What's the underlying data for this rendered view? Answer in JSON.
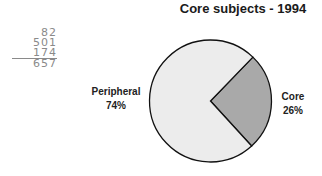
{
  "chart_data": {
    "type": "pie",
    "title": "Core subjects - 1994",
    "categories": [
      "Core",
      "Peripheral"
    ],
    "values": [
      26,
      74
    ],
    "labels": [
      {
        "name": "Core",
        "value": "26%"
      },
      {
        "name": "Peripheral",
        "value": "74%"
      }
    ],
    "colors": {
      "Core": "#a9a9a9",
      "Peripheral": "#ececec",
      "outline": "#111111"
    },
    "legend": "none (direct labels)",
    "start_angle_deg": -46,
    "direction": "clockwise from Core"
  },
  "annotations": {
    "handwritten": [
      "82",
      "501",
      "174",
      "657"
    ]
  }
}
